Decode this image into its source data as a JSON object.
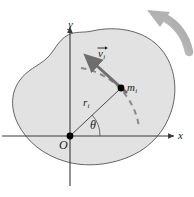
{
  "figure": {
    "background_color": "#ffffff",
    "body_fill_color": "#e2e2e2",
    "body_stroke_color": "#555555",
    "axis_color": "#444444",
    "vector_color": "#6e6e6e",
    "dashed_path_color": "#8a8a8a",
    "rotation_arrow_color": "#b0b0b0",
    "point_color": "#000000"
  },
  "axes": {
    "x_label": "x",
    "y_label": "y",
    "origin_label": "O",
    "origin_px": {
      "x": 70,
      "y": 136
    },
    "x_axis_start_px": {
      "x": 2,
      "y": 136
    },
    "x_axis_end_px": {
      "x": 176,
      "y": 136
    },
    "y_axis_top_px": {
      "x": 70,
      "y": 25
    },
    "y_axis_bottom_px": {
      "x": 70,
      "y": 186
    }
  },
  "labels": {
    "angle": "θ",
    "mass": {
      "base": "m",
      "sub": "i"
    },
    "radius": {
      "base": "r",
      "sub": "i"
    },
    "velocity": {
      "base": "v",
      "sub": "i"
    }
  },
  "particle": {
    "name": "mass-element",
    "position_px": {
      "x": 121,
      "y": 88
    },
    "radius_px": 3.2
  },
  "radius_vector": {
    "name": "position-vector-r-i",
    "from_px": {
      "x": 70,
      "y": 136
    },
    "to_px": {
      "x": 121,
      "y": 88
    }
  },
  "velocity_vector": {
    "name": "velocity-vector-v-i",
    "from_px": {
      "x": 126,
      "y": 92
    },
    "to_px": {
      "x": 85,
      "y": 55
    },
    "description": "tangential velocity, perpendicular to r_i"
  },
  "angle_arc": {
    "name": "theta-arc",
    "center_px": {
      "x": 70,
      "y": 136
    },
    "radius_px": 30,
    "start_deg": 0,
    "end_deg": 43
  },
  "circular_path": {
    "name": "dashed-circular-path",
    "center_px": {
      "x": 70,
      "y": 136
    },
    "radius_px": 70,
    "style": "dashed"
  },
  "rotation_arrow": {
    "name": "rotation-direction-arrow",
    "description": "curved gray arrow in upper-right indicating counterclockwise rotation sense",
    "tip_px": {
      "x": 148,
      "y": 11
    },
    "tail_px": {
      "x": 190,
      "y": 48
    }
  },
  "body_outline": {
    "name": "rigid-body-blob",
    "description": "irregular closed blob representing the rigid body"
  }
}
